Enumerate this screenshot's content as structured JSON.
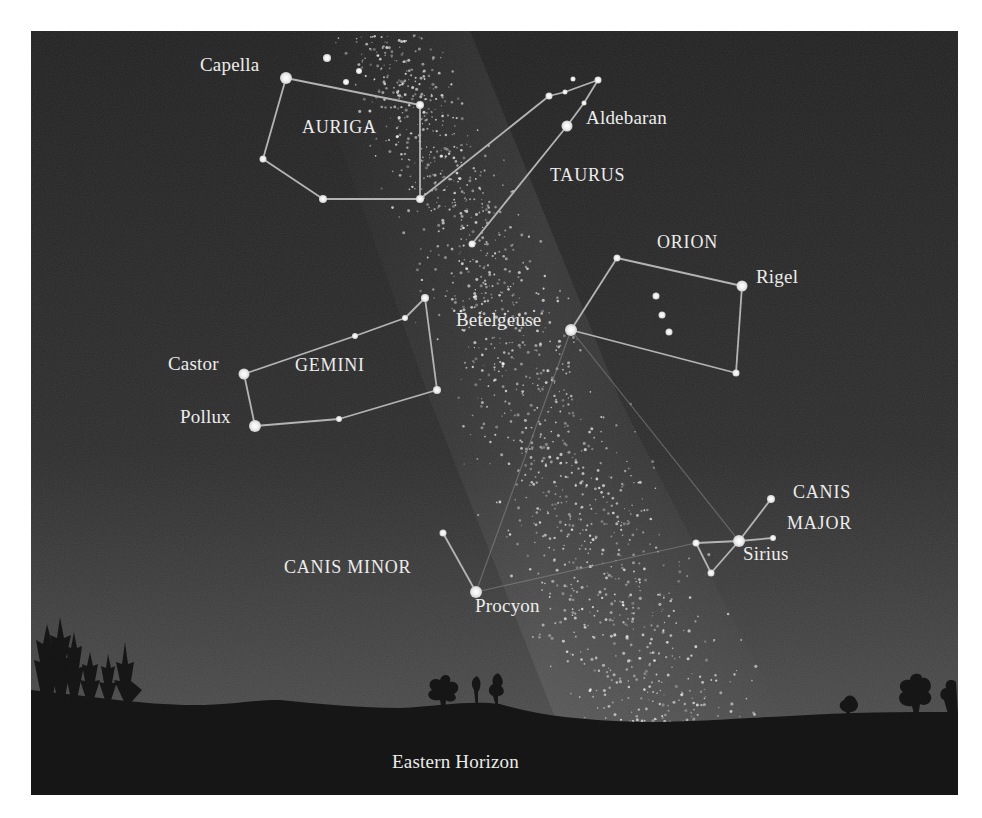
{
  "figure": {
    "caption": "Eastern Horizon",
    "colors": {
      "sky_top": "#1e1e1e",
      "sky_mid": "#2a2a2a",
      "sky_horizon": "#4a4a4a",
      "ground": "#161616",
      "star": "#f2f2f2",
      "line": "#a8a8a8",
      "label": "#ececec"
    }
  },
  "labels": {
    "constellations": [
      {
        "id": "auriga",
        "text": "AURIGA",
        "x": 302,
        "y": 127
      },
      {
        "id": "taurus",
        "text": "TAURUS",
        "x": 550,
        "y": 175
      },
      {
        "id": "orion",
        "text": "ORION",
        "x": 657,
        "y": 242
      },
      {
        "id": "gemini",
        "text": "GEMINI",
        "x": 295,
        "y": 365
      },
      {
        "id": "canis-minor",
        "text": "CANIS MINOR",
        "x": 284,
        "y": 567
      },
      {
        "id": "canis-major-1",
        "text": "CANIS",
        "x": 793,
        "y": 492
      },
      {
        "id": "canis-major-2",
        "text": "MAJOR",
        "x": 787,
        "y": 523
      }
    ],
    "stars": [
      {
        "id": "capella",
        "text": "Capella",
        "x": 200,
        "y": 64
      },
      {
        "id": "aldebaran",
        "text": "Aldebaran",
        "x": 586,
        "y": 117
      },
      {
        "id": "rigel",
        "text": "Rigel",
        "x": 756,
        "y": 276
      },
      {
        "id": "betelgeuse",
        "text": "Betelgeuse",
        "x": 456,
        "y": 319
      },
      {
        "id": "castor",
        "text": "Castor",
        "x": 168,
        "y": 363
      },
      {
        "id": "pollux",
        "text": "Pollux",
        "x": 180,
        "y": 416
      },
      {
        "id": "sirius",
        "text": "Sirius",
        "x": 743,
        "y": 553
      },
      {
        "id": "procyon",
        "text": "Procyon",
        "x": 475,
        "y": 605
      }
    ],
    "horizon": {
      "text": "Eastern Horizon",
      "x": 392,
      "y": 761
    }
  },
  "stars": [
    {
      "id": "capella",
      "x": 286,
      "y": 78,
      "r": 6
    },
    {
      "id": "aur2",
      "x": 420,
      "y": 105,
      "r": 4
    },
    {
      "id": "aur3",
      "x": 420,
      "y": 199,
      "r": 4
    },
    {
      "id": "aur4",
      "x": 323,
      "y": 199,
      "r": 4
    },
    {
      "id": "aur5",
      "x": 263,
      "y": 159,
      "r": 3.5
    },
    {
      "id": "aur-e1",
      "x": 327,
      "y": 58,
      "r": 4
    },
    {
      "id": "aur-e2",
      "x": 359,
      "y": 71,
      "r": 3
    },
    {
      "id": "aur-e3",
      "x": 346,
      "y": 82,
      "r": 3
    },
    {
      "id": "tau1",
      "x": 549,
      "y": 96,
      "r": 3.5
    },
    {
      "id": "tau2",
      "x": 565,
      "y": 92,
      "r": 2.5
    },
    {
      "id": "tau-apex",
      "x": 598,
      "y": 80,
      "r": 3.5
    },
    {
      "id": "tau-e1",
      "x": 573,
      "y": 79,
      "r": 2.5
    },
    {
      "id": "tau3",
      "x": 584,
      "y": 103,
      "r": 2.5
    },
    {
      "id": "aldebaran",
      "x": 567,
      "y": 126,
      "r": 5.5
    },
    {
      "id": "tau4",
      "x": 472,
      "y": 244,
      "r": 3.5
    },
    {
      "id": "betelgeuse",
      "x": 571,
      "y": 330,
      "r": 6
    },
    {
      "id": "ori2",
      "x": 617,
      "y": 258,
      "r": 3.5
    },
    {
      "id": "rigel",
      "x": 742,
      "y": 286,
      "r": 5.5
    },
    {
      "id": "ori4",
      "x": 736,
      "y": 373,
      "r": 3.5
    },
    {
      "id": "belt1",
      "x": 656,
      "y": 296,
      "r": 3.5
    },
    {
      "id": "belt2",
      "x": 662,
      "y": 315,
      "r": 3.5
    },
    {
      "id": "belt3",
      "x": 669,
      "y": 332,
      "r": 3.5
    },
    {
      "id": "castor",
      "x": 244,
      "y": 374,
      "r": 5.5
    },
    {
      "id": "gem2",
      "x": 355,
      "y": 336,
      "r": 3
    },
    {
      "id": "gem3",
      "x": 405,
      "y": 318,
      "r": 3
    },
    {
      "id": "gem4",
      "x": 425,
      "y": 298,
      "r": 4
    },
    {
      "id": "gem5",
      "x": 437,
      "y": 390,
      "r": 4
    },
    {
      "id": "gem6",
      "x": 339,
      "y": 419,
      "r": 3
    },
    {
      "id": "pollux",
      "x": 255,
      "y": 426,
      "r": 6
    },
    {
      "id": "cmi1",
      "x": 443,
      "y": 533,
      "r": 3.5
    },
    {
      "id": "procyon",
      "x": 476,
      "y": 592,
      "r": 6
    },
    {
      "id": "sirius",
      "x": 739,
      "y": 541,
      "r": 6
    },
    {
      "id": "cma-top",
      "x": 771,
      "y": 499,
      "r": 4
    },
    {
      "id": "cma-right",
      "x": 773,
      "y": 538,
      "r": 3
    },
    {
      "id": "cma-left",
      "x": 696,
      "y": 543,
      "r": 3.5
    },
    {
      "id": "cma-bottom",
      "x": 711,
      "y": 573,
      "r": 3.5
    }
  ],
  "lines": [
    [
      "capella",
      "aur2"
    ],
    [
      "aur2",
      "aur3"
    ],
    [
      "aur3",
      "aur4"
    ],
    [
      "aur4",
      "aur5"
    ],
    [
      "aur5",
      "capella"
    ],
    [
      "aur3",
      "tau1"
    ],
    [
      "tau1",
      "tau2"
    ],
    [
      "tau2",
      "tau-apex"
    ],
    [
      "tau-apex",
      "tau3"
    ],
    [
      "tau3",
      "aldebaran"
    ],
    [
      "aldebaran",
      "tau4"
    ],
    [
      "betelgeuse",
      "ori2"
    ],
    [
      "ori2",
      "rigel"
    ],
    [
      "rigel",
      "ori4"
    ],
    [
      "ori4",
      "betelgeuse"
    ],
    [
      "castor",
      "gem2"
    ],
    [
      "gem2",
      "gem3"
    ],
    [
      "gem3",
      "gem4"
    ],
    [
      "gem4",
      "gem5"
    ],
    [
      "gem5",
      "gem6"
    ],
    [
      "gem6",
      "pollux"
    ],
    [
      "pollux",
      "castor"
    ],
    [
      "cmi1",
      "procyon"
    ],
    [
      "cma-top",
      "sirius"
    ],
    [
      "sirius",
      "cma-bottom"
    ],
    [
      "cma-left",
      "sirius"
    ],
    [
      "sirius",
      "cma-right"
    ],
    [
      "cma-left",
      "cma-bottom"
    ]
  ],
  "faint_lines": [
    [
      "betelgeuse",
      "procyon"
    ],
    [
      "betelgeuse",
      "sirius"
    ],
    [
      "procyon",
      "cma-left"
    ]
  ]
}
